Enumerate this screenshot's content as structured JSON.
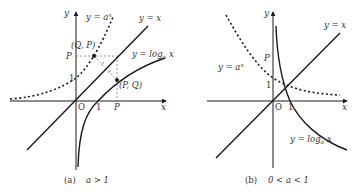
{
  "panel_a": {
    "caption_tag": "(a)",
    "caption_cond": "a > 1",
    "axis_x": "x",
    "axis_y": "y",
    "origin": "O",
    "tick_one_x": "1",
    "tick_p_x": "P",
    "tick_one_y": "1",
    "tick_p_y": "P",
    "label_exp": "y = a",
    "label_exp_sup": "x",
    "label_identity": "y = x",
    "label_log": "y = log",
    "label_log_sub": "a",
    "label_log_var": " x",
    "point_qp": "(Q, P)",
    "point_pq": "(P, Q)"
  },
  "panel_b": {
    "caption_tag": "(b)",
    "caption_cond": "0 < a < 1",
    "axis_x": "x",
    "axis_y": "y",
    "origin": "O",
    "tick_one_x": "1",
    "tick_one_y": "1",
    "tick_p_y": "P",
    "label_exp": "y = a",
    "label_exp_sup": "x",
    "label_identity": "y = x",
    "label_log": "y = log",
    "label_log_sub": "a",
    "label_log_var": " x"
  },
  "colors": {
    "stroke": "#1a1a1a",
    "dashed_guide": "#555555",
    "text": "#333333"
  }
}
